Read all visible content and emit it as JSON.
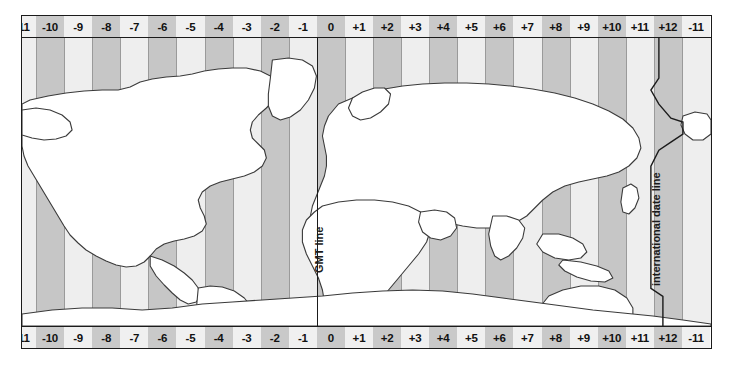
{
  "map": {
    "title": "World time zone map",
    "background_color": "#ffffff",
    "frame_color": "#1b1b1b",
    "land_color": "#ffffff",
    "land_outline_color": "#3a3a3a",
    "band_light_color": "#eeeeee",
    "band_dark_color": "#c6c6c6",
    "label_light_color": "#f0f0f0",
    "label_dark_color": "#c9c9c9"
  },
  "axis": {
    "zone_labels": [
      "-11",
      "-10",
      "-9",
      "-8",
      "-7",
      "-6",
      "-5",
      "-4",
      "-3",
      "-2",
      "-1",
      "0",
      "+1",
      "+2",
      "+3",
      "+4",
      "+5",
      "+6",
      "+7",
      "+8",
      "+9",
      "+10",
      "+11",
      "+12",
      "-11"
    ],
    "top_row_present": true,
    "bottom_row_present": true
  },
  "annotations": {
    "gmt_line": "GMT line",
    "international_date_line": "international date line"
  },
  "chart_data": {
    "type": "map",
    "categories": [
      "-11",
      "-10",
      "-9",
      "-8",
      "-7",
      "-6",
      "-5",
      "-4",
      "-3",
      "-2",
      "-1",
      "0",
      "+1",
      "+2",
      "+3",
      "+4",
      "+5",
      "+6",
      "+7",
      "+8",
      "+9",
      "+10",
      "+11",
      "+12",
      "-11"
    ],
    "values": [
      -11,
      -10,
      -9,
      -8,
      -7,
      -6,
      -5,
      -4,
      -3,
      -2,
      -1,
      0,
      1,
      2,
      3,
      4,
      5,
      6,
      7,
      8,
      9,
      10,
      11,
      12,
      -11
    ],
    "xlabel": "UTC offset (hours)",
    "ylabel": "",
    "legend": [
      "GMT line",
      "international date line"
    ],
    "grid": true
  }
}
